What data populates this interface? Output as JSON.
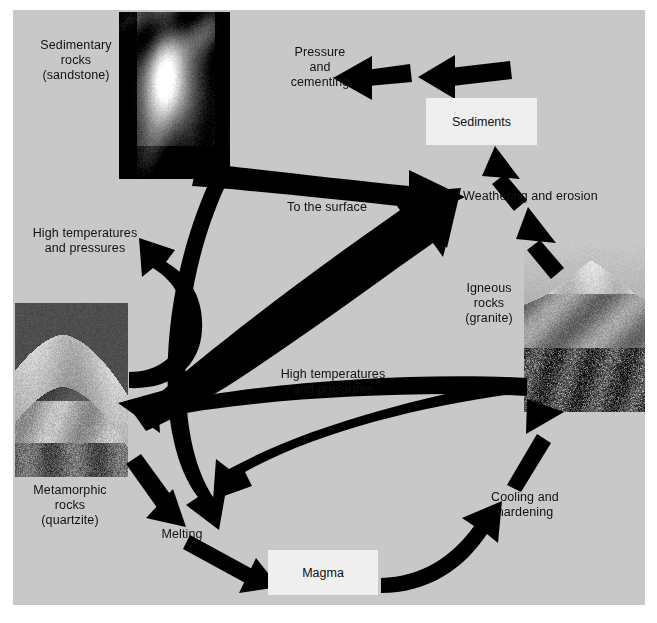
{
  "diagram": {
    "background_color": "#c8c8c8",
    "page_background_color": "#ffffff",
    "arrow_color": "#000000",
    "text_color": "#111111",
    "box_fill_color": "#efefef"
  },
  "labels": {
    "sedimentary_rocks": "Sedimentary\nrocks\n(sandstone)",
    "pressure_and_cementing": "Pressure\nand\ncementing",
    "weathering_and_erosion": "Weathering and erosion",
    "to_the_surface": "To the surface",
    "high_temperatures_left": "High temperatures\nand pressures",
    "high_temperatures_center": "High temperatures\nand pressures",
    "igneous_rocks": "Igneous\nrocks\n(granite)",
    "metamorphic_rocks": "Metamorphic\nrocks\n(quartzite)",
    "melting": "Melting",
    "cooling_and_hardening": "Cooling and\nhardening"
  },
  "boxes": {
    "sediments": "Sediments",
    "magma": "Magma"
  },
  "photos": {
    "sedimentary": {
      "caption": "Sedimentary rocks (sandstone)",
      "alt": "slot canyon sandstone photograph"
    },
    "metamorphic": {
      "caption": "Metamorphic rocks (quartzite)",
      "alt": "quartzite rock outcrop photograph"
    },
    "igneous": {
      "caption": "Igneous rocks (granite)",
      "alt": "granite dome mountain photograph"
    }
  },
  "arrows": [
    {
      "id": "sediments-to-sedimentary",
      "from": "Sediments",
      "to": "Sedimentary rocks",
      "via": "Pressure and cementing"
    },
    {
      "id": "weathering-to-pressure",
      "from": "Weathering and erosion",
      "to": "Pressure and cementing"
    },
    {
      "id": "sedimentary-to-weathering",
      "from": "Sedimentary rocks",
      "to": "Weathering and erosion"
    },
    {
      "id": "sedimentary-to-high-temp",
      "from": "Sedimentary rocks",
      "to": "High temperatures and pressures"
    },
    {
      "id": "high-temp-to-metamorphic",
      "from": "High temperatures and pressures",
      "to": "Metamorphic rocks"
    },
    {
      "id": "igneous-to-weathering",
      "from": "Igneous rocks",
      "to": "Weathering and erosion"
    },
    {
      "id": "metamorphic-to-weathering",
      "from": "Metamorphic rocks",
      "to": "Weathering and erosion",
      "via": "To the surface"
    },
    {
      "id": "igneous-to-high-temp-curve",
      "from": "Igneous rocks",
      "to": "High temperatures and pressures"
    },
    {
      "id": "igneous-to-metamorphic",
      "from": "Igneous rocks",
      "to": "Metamorphic rocks",
      "via": "High temperatures and pressures"
    },
    {
      "id": "metamorphic-to-melting",
      "from": "Metamorphic rocks",
      "to": "Melting"
    },
    {
      "id": "sedimentary-to-melting",
      "from": "Sedimentary rocks",
      "to": "Melting"
    },
    {
      "id": "igneous-to-melting",
      "from": "Igneous rocks",
      "to": "Melting"
    },
    {
      "id": "melting-to-magma",
      "from": "Melting",
      "to": "Magma"
    },
    {
      "id": "magma-to-igneous",
      "from": "Magma",
      "to": "Igneous rocks",
      "via": "Cooling and hardening"
    },
    {
      "id": "weathering-to-sediments",
      "from": "Weathering and erosion",
      "to": "Sediments"
    }
  ]
}
